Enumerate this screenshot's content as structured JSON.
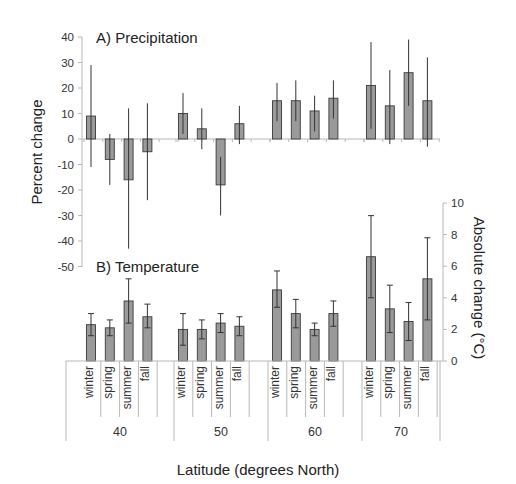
{
  "chart_data": [
    {
      "type": "bar",
      "title": "A) Precipitation",
      "ylabel": "Percent change",
      "xlabel": "Latitude (degrees North)",
      "ylim": [
        -50,
        40
      ],
      "yticks": [
        40,
        30,
        20,
        10,
        0,
        -10,
        -20,
        -30,
        -40,
        -50
      ],
      "groups": [
        "40",
        "50",
        "60",
        "70"
      ],
      "categories": [
        "winter",
        "spring",
        "summer",
        "fall"
      ],
      "series": [
        {
          "group": "40",
          "values": [
            9,
            -8,
            -16,
            -5
          ],
          "err_low": [
            -11,
            -18,
            -43,
            -24
          ],
          "err_high": [
            29,
            2,
            12,
            14
          ]
        },
        {
          "group": "50",
          "values": [
            10,
            4,
            -18,
            6
          ],
          "err_low": [
            2,
            -4,
            -30,
            -2
          ],
          "err_high": [
            18,
            12,
            -7,
            13
          ]
        },
        {
          "group": "60",
          "values": [
            15,
            15,
            11,
            16
          ],
          "err_low": [
            7,
            7,
            3,
            8
          ],
          "err_high": [
            22,
            23,
            17,
            23
          ]
        },
        {
          "group": "70",
          "values": [
            21,
            13,
            26,
            15
          ],
          "err_low": [
            4,
            -2,
            13,
            -3
          ],
          "err_high": [
            38,
            27,
            39,
            32
          ]
        }
      ],
      "grid": false,
      "legend": null
    },
    {
      "type": "bar",
      "title": "B) Temperature",
      "ylabel": "Absolute change (°C)",
      "xlabel": "Latitude (degrees North)",
      "ylim": [
        0,
        10
      ],
      "yticks": [
        10,
        8,
        6,
        4,
        2,
        0
      ],
      "groups": [
        "40",
        "50",
        "60",
        "70"
      ],
      "categories": [
        "winter",
        "spring",
        "summer",
        "fall"
      ],
      "series": [
        {
          "group": "40",
          "values": [
            2.3,
            2.1,
            3.8,
            2.8
          ],
          "err_low": [
            1.6,
            1.6,
            2.4,
            2.1
          ],
          "err_high": [
            3.0,
            2.6,
            5.2,
            3.6
          ]
        },
        {
          "group": "50",
          "values": [
            2.0,
            2.0,
            2.4,
            2.2
          ],
          "err_low": [
            1.0,
            1.4,
            1.8,
            1.6
          ],
          "err_high": [
            3.0,
            2.6,
            3.0,
            2.8
          ]
        },
        {
          "group": "60",
          "values": [
            4.5,
            3.0,
            2.0,
            3.0
          ],
          "err_low": [
            3.4,
            2.1,
            1.6,
            2.2
          ],
          "err_high": [
            5.7,
            3.9,
            2.4,
            3.8
          ]
        },
        {
          "group": "70",
          "values": [
            6.6,
            3.3,
            2.5,
            5.2
          ],
          "err_low": [
            4.0,
            1.8,
            1.3,
            2.6
          ],
          "err_high": [
            9.2,
            4.8,
            3.7,
            7.8
          ]
        }
      ],
      "grid": false,
      "legend": null
    }
  ],
  "labels": {
    "precip_title": "A) Precipitation",
    "temp_title": "B) Temperature",
    "left_axis_title": "Percent change",
    "right_axis_title": "Absolute change (°C)",
    "x_axis_title": "Latitude (degrees North)"
  },
  "colors": {
    "bar_fill": "#9a9a9a",
    "bar_stroke": "#3a3a3a",
    "axis": "#b8b8b8",
    "error_bar": "#333333"
  }
}
